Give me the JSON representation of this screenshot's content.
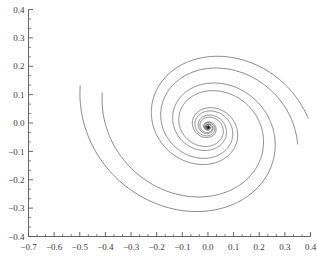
{
  "chart_data": {
    "type": "line",
    "title": "",
    "subtitle": "",
    "xlabel": "",
    "ylabel": "",
    "grid": false,
    "legend": "none",
    "xlim": [
      -0.7,
      0.4
    ],
    "ylim": [
      -0.4,
      0.4
    ],
    "xticks": [
      -0.7,
      -0.6,
      -0.5,
      -0.4,
      -0.3,
      -0.2,
      -0.1,
      0.0,
      0.1,
      0.2,
      0.3,
      0.4
    ],
    "yticks": [
      -0.4,
      -0.3,
      -0.2,
      -0.1,
      0.0,
      0.1,
      0.2,
      0.3,
      0.4
    ],
    "xtick_labels": [
      "−0.7",
      "−0.6",
      "−0.5",
      "−0.4",
      "−0.3",
      "−0.2",
      "−0.1",
      "0.0",
      "0.1",
      "0.2",
      "0.3",
      "0.4"
    ],
    "ytick_labels": [
      "−0.4",
      "−0.3",
      "−0.2",
      "−0.1",
      "0.0",
      "0.1",
      "0.2",
      "0.3",
      "0.4"
    ],
    "minor_ticks_per_interval": 2,
    "line_color": "#555555",
    "axis_color": "#555555",
    "background_color": "#ffffff",
    "focus": {
      "x": 0.0,
      "y": -0.015,
      "type": "stable-spiral-focus"
    },
    "series": [
      {
        "name": "trajectory-1",
        "spiral": {
          "cx": 0.0,
          "cy": -0.015,
          "r0": 0.52,
          "decay": 0.205,
          "theta_start": 3.05,
          "theta_end": 26.5,
          "ellipse_ratio": 0.82,
          "tilt_deg": -12
        }
      },
      {
        "name": "trajectory-2",
        "spiral": {
          "cx": 0.0,
          "cy": -0.015,
          "r0": 0.43,
          "decay": 0.205,
          "theta_start": 3.05,
          "theta_end": 26.5,
          "ellipse_ratio": 0.82,
          "tilt_deg": -12
        }
      },
      {
        "name": "trajectory-3",
        "spiral": {
          "cx": 0.0,
          "cy": -0.015,
          "r0": 0.4,
          "decay": 0.205,
          "theta_start": 0.35,
          "theta_end": 26.5,
          "ellipse_ratio": 0.82,
          "tilt_deg": -12
        }
      },
      {
        "name": "trajectory-4",
        "spiral": {
          "cx": 0.0,
          "cy": -0.015,
          "r0": 0.355,
          "decay": 0.205,
          "theta_start": 0.05,
          "theta_end": 26.5,
          "ellipse_ratio": 0.82,
          "tilt_deg": -12
        }
      }
    ]
  }
}
